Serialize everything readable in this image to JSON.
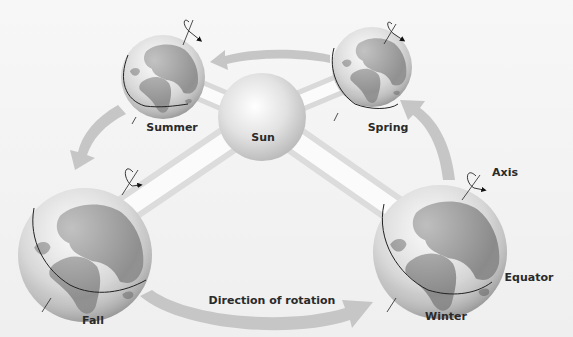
{
  "diagram": {
    "center": {
      "label": "Sun"
    },
    "seasons": [
      {
        "label": "Summer"
      },
      {
        "label": "Spring"
      },
      {
        "label": "Fall"
      },
      {
        "label": "Winter"
      }
    ],
    "annotations": {
      "axis": "Axis",
      "equator": "Equator",
      "direction": "Direction of rotation"
    },
    "colors": {
      "background": "#f2f2f2",
      "ocean": "#d2d2d2",
      "land": "#8e8e8e",
      "orbit_arrow": "#c4c4c4",
      "rod": "#ffffff",
      "line": "#222222",
      "label_text": "#2a2a2a"
    }
  }
}
